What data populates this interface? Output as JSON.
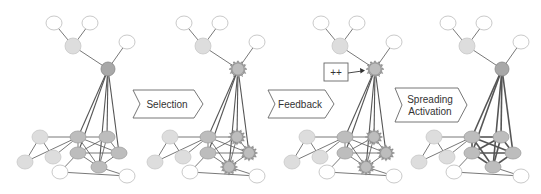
{
  "diagram": {
    "colors": {
      "edge": "#555555",
      "node_white_fill": "#ffffff",
      "node_white_stroke": "#bbbbbb",
      "node_light_fill": "#dddddd",
      "node_mid_fill": "#bdbdbd",
      "node_dark_fill": "#a8a8a8",
      "arrow_stroke": "#666666"
    },
    "panel_offsets": [
      0,
      130,
      267,
      394
    ],
    "nodes": [
      {
        "id": "t1",
        "x": 54,
        "y": 23,
        "type": "white"
      },
      {
        "id": "t2",
        "x": 90,
        "y": 23,
        "type": "white"
      },
      {
        "id": "g",
        "x": 73,
        "y": 46,
        "type": "light"
      },
      {
        "id": "tr",
        "x": 127,
        "y": 42,
        "type": "white"
      },
      {
        "id": "hub",
        "x": 108,
        "y": 69,
        "type": "hub"
      },
      {
        "id": "a",
        "x": 40,
        "y": 137,
        "type": "light"
      },
      {
        "id": "b",
        "x": 25,
        "y": 162,
        "type": "light"
      },
      {
        "id": "c",
        "x": 53,
        "y": 157,
        "type": "light"
      },
      {
        "id": "d",
        "x": 78,
        "y": 137,
        "type": "mid"
      },
      {
        "id": "e",
        "x": 78,
        "y": 153,
        "type": "mid"
      },
      {
        "id": "f",
        "x": 107,
        "y": 137,
        "type": "mid"
      },
      {
        "id": "h",
        "x": 119,
        "y": 153,
        "type": "mid"
      },
      {
        "id": "i",
        "x": 99,
        "y": 167,
        "type": "mid"
      },
      {
        "id": "w1",
        "x": 60,
        "y": 172,
        "type": "white"
      },
      {
        "id": "w2",
        "x": 127,
        "y": 176,
        "type": "white"
      }
    ],
    "edges": [
      [
        "t1",
        "g"
      ],
      [
        "t2",
        "g"
      ],
      [
        "g",
        "hub"
      ],
      [
        "tr",
        "hub"
      ],
      [
        "hub",
        "d"
      ],
      [
        "hub",
        "e"
      ],
      [
        "hub",
        "f"
      ],
      [
        "hub",
        "h"
      ],
      [
        "hub",
        "i"
      ],
      [
        "a",
        "d"
      ],
      [
        "a",
        "b"
      ],
      [
        "a",
        "c"
      ],
      [
        "b",
        "d"
      ],
      [
        "c",
        "d"
      ],
      [
        "d",
        "f"
      ],
      [
        "d",
        "h"
      ],
      [
        "d",
        "i"
      ],
      [
        "e",
        "f"
      ],
      [
        "e",
        "h"
      ],
      [
        "e",
        "i"
      ],
      [
        "f",
        "h"
      ],
      [
        "f",
        "i"
      ],
      [
        "h",
        "i"
      ],
      [
        "d",
        "e"
      ],
      [
        "w1",
        "e"
      ],
      [
        "w1",
        "w2"
      ],
      [
        "i",
        "w2"
      ]
    ],
    "panels": [
      {
        "name": "initial",
        "spiky": []
      },
      {
        "name": "selection",
        "spiky": [
          "hub",
          "f",
          "h",
          "i"
        ]
      },
      {
        "name": "feedback",
        "spiky": [
          "hub",
          "f",
          "h",
          "i"
        ],
        "feedback_box": "++"
      },
      {
        "name": "spreading-activation",
        "spiky": [],
        "thick_edges": true
      }
    ],
    "stage_arrows": [
      {
        "label_lines": [
          "Selection"
        ],
        "x": 133,
        "y": 90,
        "w": 70,
        "h": 28
      },
      {
        "label_lines": [
          "Feedback"
        ],
        "x": 268,
        "y": 90,
        "w": 66,
        "h": 28
      },
      {
        "label_lines": [
          "Spreading",
          "Activation"
        ],
        "x": 395,
        "y": 88,
        "w": 72,
        "h": 34
      }
    ],
    "feedback_box": {
      "label": "++",
      "x": 324,
      "y": 63,
      "w": 24,
      "h": 18
    }
  }
}
